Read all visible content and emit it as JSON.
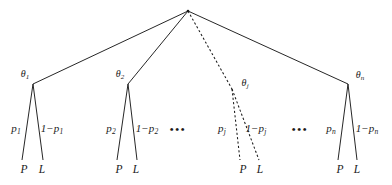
{
  "figure": {
    "type": "probability-tree-diagram",
    "width": 392,
    "height": 185,
    "background_color": "#ffffff",
    "line_color": "#1a1a1a",
    "text_color": "#1a1a1a"
  },
  "root": {
    "x": 188,
    "y": 11,
    "label": ""
  },
  "ellipses": [
    {
      "text": "•••",
      "x": 178,
      "y": 129
    },
    {
      "text": "•••",
      "x": 300,
      "y": 129
    }
  ],
  "subtrees": [
    {
      "id": "subtree-1",
      "style": "solid",
      "node": {
        "x": 33,
        "y": 84
      },
      "theta": {
        "base": "θ",
        "sub": "1",
        "x": 25,
        "y": 75
      },
      "left_branch": {
        "label": {
          "base": "p",
          "sub": "1",
          "x": 16,
          "y": 129
        },
        "leaf": {
          "text": "P",
          "x": 24,
          "y": 170
        },
        "end_x": 22,
        "end_y": 160
      },
      "right_branch": {
        "label": {
          "base": "1−p",
          "sub": "1",
          "x": 52,
          "y": 129
        },
        "leaf": {
          "text": "L",
          "x": 42,
          "y": 170
        },
        "end_x": 43,
        "end_y": 160
      }
    },
    {
      "id": "subtree-2",
      "style": "solid",
      "node": {
        "x": 128,
        "y": 84
      },
      "theta": {
        "base": "θ",
        "sub": "2",
        "x": 120,
        "y": 75
      },
      "left_branch": {
        "label": {
          "base": "p",
          "sub": "2",
          "x": 111,
          "y": 129
        },
        "leaf": {
          "text": "P",
          "x": 119,
          "y": 170
        },
        "end_x": 117,
        "end_y": 160
      },
      "right_branch": {
        "label": {
          "base": "1−p",
          "sub": "2",
          "x": 147,
          "y": 129
        },
        "leaf": {
          "text": "L",
          "x": 136,
          "y": 170
        },
        "end_x": 137,
        "end_y": 160
      }
    },
    {
      "id": "subtree-j",
      "style": "dashed",
      "node": {
        "x": 232,
        "y": 89
      },
      "theta": {
        "base": "θ",
        "sub": "j",
        "x": 245,
        "y": 84
      },
      "left_branch": {
        "label": {
          "base": "p",
          "sub": "j",
          "x": 222,
          "y": 129
        },
        "leaf": {
          "text": "P",
          "x": 243,
          "y": 170
        },
        "end_x": 240,
        "end_y": 160
      },
      "right_branch": {
        "label": {
          "base": "1−p",
          "sub": "j",
          "x": 256,
          "y": 129
        },
        "leaf": {
          "text": "L",
          "x": 260,
          "y": 170
        },
        "end_x": 259,
        "end_y": 160
      }
    },
    {
      "id": "subtree-n",
      "style": "solid",
      "node": {
        "x": 348,
        "y": 84
      },
      "theta": {
        "base": "θ",
        "sub": "n",
        "x": 360,
        "y": 76
      },
      "left_branch": {
        "label": {
          "base": "p",
          "sub": "n",
          "x": 331,
          "y": 129
        },
        "leaf": {
          "text": "P",
          "x": 340,
          "y": 170
        },
        "end_x": 338,
        "end_y": 160
      },
      "right_branch": {
        "label": {
          "base": "1−p",
          "sub": "n",
          "x": 367,
          "y": 129
        },
        "leaf": {
          "text": "L",
          "x": 357,
          "y": 170
        },
        "end_x": 357,
        "end_y": 160
      }
    }
  ]
}
